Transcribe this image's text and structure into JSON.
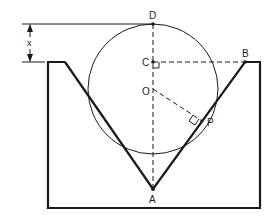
{
  "diagram": {
    "type": "geometry",
    "labels": {
      "D": "D",
      "C": "C",
      "O": "O",
      "B": "B",
      "P": "P",
      "A": "A",
      "x": "x"
    },
    "points": {
      "D": [
        153,
        24
      ],
      "C": [
        153,
        62
      ],
      "O": [
        153,
        89
      ],
      "B": [
        245,
        62
      ],
      "P": [
        202,
        121
      ],
      "A": [
        153,
        189
      ]
    },
    "circle": {
      "center": "O",
      "radius": 65
    },
    "colors": {
      "stroke": "#1a1a1a",
      "background": "#ffffff"
    }
  }
}
